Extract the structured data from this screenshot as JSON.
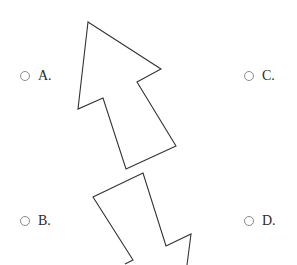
{
  "question": {
    "figures": [
      {
        "id": "arrow-up",
        "description": "outlined arrow pointing up-left",
        "points": [
          [
            88,
            22
          ],
          [
            161,
            69
          ],
          [
            137,
            82
          ],
          [
            176,
            146
          ],
          [
            126,
            169
          ],
          [
            103,
            98
          ],
          [
            78,
            109
          ]
        ],
        "stroke": "#333333"
      },
      {
        "id": "arrow-down-partial",
        "description": "outlined arrow shape pointing down, cut off at bottom edge",
        "points": [
          [
            125,
            264
          ],
          [
            133,
            260
          ],
          [
            93,
            197
          ],
          [
            143,
            173
          ],
          [
            166,
            246
          ],
          [
            191,
            234
          ],
          [
            187,
            265
          ]
        ],
        "stroke": "#333333"
      }
    ],
    "options": [
      {
        "key": "A",
        "label": "A."
      },
      {
        "key": "B",
        "label": "B."
      },
      {
        "key": "C",
        "label": "C."
      },
      {
        "key": "D",
        "label": "D."
      }
    ]
  }
}
